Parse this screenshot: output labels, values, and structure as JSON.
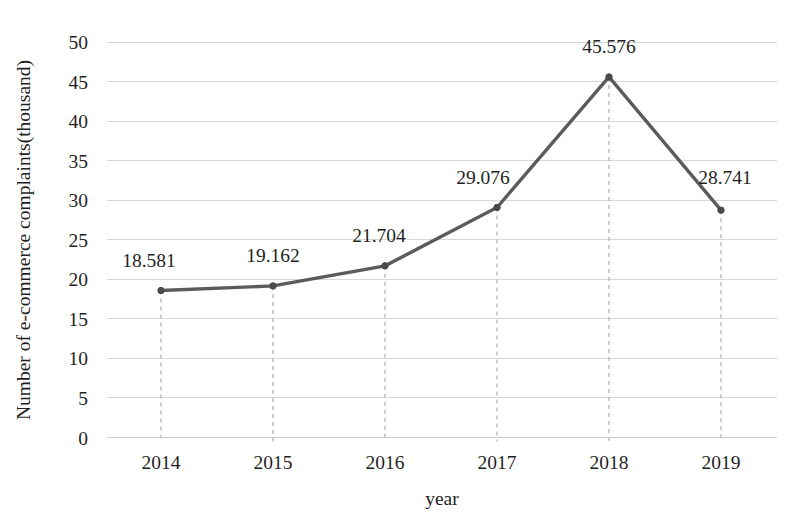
{
  "chart_data": {
    "type": "line",
    "title": "",
    "xlabel": "year",
    "ylabel": "Number of e-commerce complaints(thousand)",
    "categories": [
      "2014",
      "2015",
      "2016",
      "2017",
      "2018",
      "2019"
    ],
    "values": [
      18.581,
      19.162,
      21.704,
      29.076,
      45.576,
      28.741
    ],
    "point_labels": [
      "18.581",
      "19.162",
      "21.704",
      "29.076",
      "45.576",
      "28.741"
    ],
    "series": [
      {
        "name": "Number of e-commerce complaints(thousand)",
        "values": [
          18.581,
          19.162,
          21.704,
          29.076,
          45.576,
          28.741
        ]
      }
    ],
    "ylim": [
      0,
      50
    ],
    "ytick_labels": [
      "0",
      "5",
      "10",
      "15",
      "20",
      "25",
      "30",
      "35",
      "40",
      "45",
      "50"
    ],
    "ytick_values": [
      0,
      5,
      10,
      15,
      20,
      25,
      30,
      35,
      40,
      45,
      50
    ],
    "xtick_labels": [
      "2014",
      "2015",
      "2016",
      "2017",
      "2018",
      "2019"
    ],
    "grid": "horizontal",
    "legend": "none",
    "droplines": true,
    "marker": "circle",
    "colors": {
      "line": "#5b5b5b",
      "marker": "#4a4a4a",
      "grid": "#d8d8d8",
      "dropline": "#b4b4b4",
      "text": "#1f1f1f",
      "background": "#ffffff"
    }
  }
}
